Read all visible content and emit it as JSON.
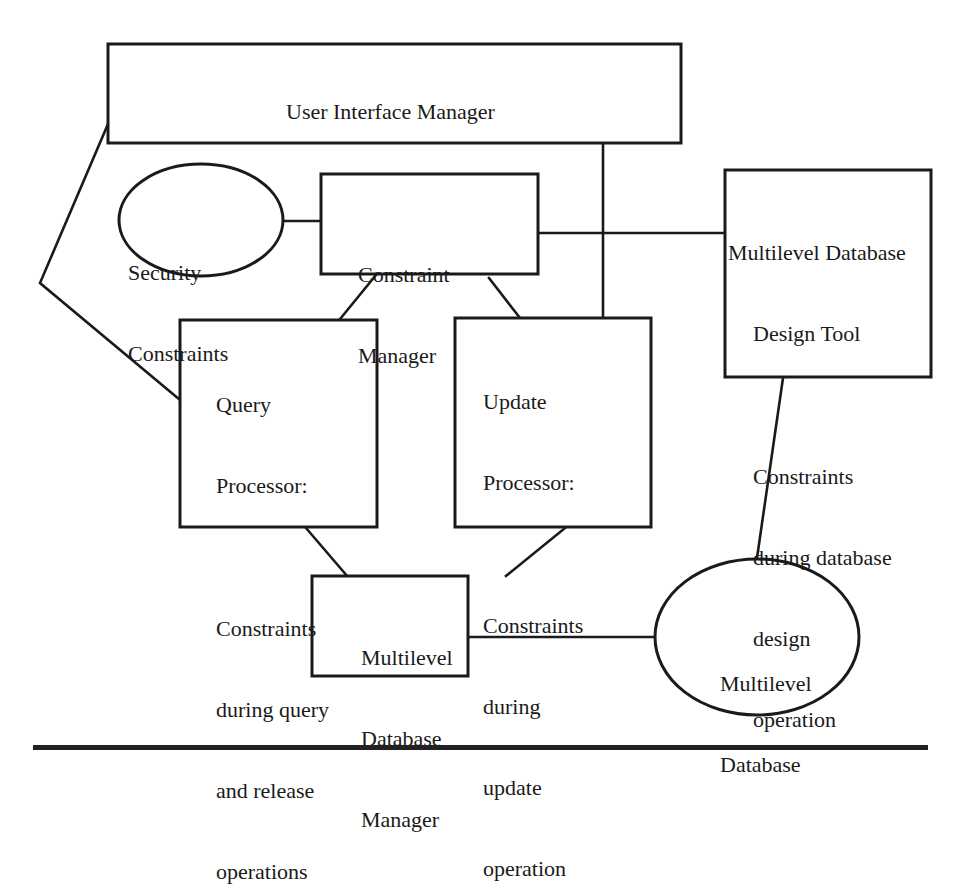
{
  "diagram": {
    "nodes": {
      "user_interface_manager": {
        "label": "User Interface Manager"
      },
      "security_constraints": {
        "line1": "Security",
        "line2": "Constraints"
      },
      "constraint_manager": {
        "line1": "Constraint",
        "line2": "Manager"
      },
      "design_tool": {
        "title1": "Multilevel Database",
        "title2": "Design Tool",
        "desc1": "Constraints",
        "desc2": "during database",
        "desc3": "design",
        "desc4": "operation"
      },
      "query_processor": {
        "title1": "Query",
        "title2": "Processor:",
        "desc1": "Constraints",
        "desc2": "during query",
        "desc3": "and release",
        "desc4": "operations"
      },
      "update_processor": {
        "title1": "Update",
        "title2": "Processor:",
        "desc1": "Constraints",
        "desc2": "during",
        "desc3": "update",
        "desc4": "operation"
      },
      "database_manager": {
        "line1": "Multilevel",
        "line2": "Database",
        "line3": "Manager"
      },
      "database": {
        "line1": "Multilevel",
        "line2": "Database"
      }
    },
    "edges": [
      [
        "user_interface_manager",
        "query_processor"
      ],
      [
        "user_interface_manager",
        "update_processor"
      ],
      [
        "security_constraints",
        "constraint_manager"
      ],
      [
        "constraint_manager",
        "design_tool"
      ],
      [
        "constraint_manager",
        "query_processor"
      ],
      [
        "constraint_manager",
        "update_processor"
      ],
      [
        "query_processor",
        "database_manager"
      ],
      [
        "update_processor",
        "database_manager"
      ],
      [
        "database_manager",
        "database"
      ],
      [
        "design_tool",
        "database"
      ]
    ],
    "colors": {
      "stroke": "#1a1a1a",
      "background": "#ffffff"
    }
  }
}
